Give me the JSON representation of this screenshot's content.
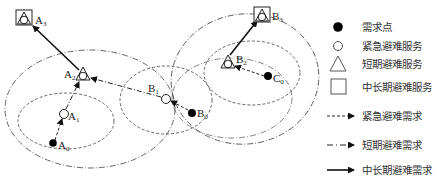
{
  "diagram": {
    "nodes": [
      {
        "id": "A0",
        "base": "A",
        "sub": "0",
        "type": "demand_point"
      },
      {
        "id": "A1",
        "base": "A",
        "sub": "1",
        "type": "emergency_service"
      },
      {
        "id": "A2",
        "base": "A",
        "sub": "2",
        "type": "short_term_service"
      },
      {
        "id": "A3",
        "base": "A",
        "sub": "3",
        "type": "long_term_service"
      },
      {
        "id": "B0",
        "base": "B",
        "sub": "0",
        "type": "demand_point"
      },
      {
        "id": "B1",
        "base": "B",
        "sub": "1",
        "type": "emergency_service"
      },
      {
        "id": "B2",
        "base": "B",
        "sub": "2",
        "type": "short_term_service"
      },
      {
        "id": "B3",
        "base": "B",
        "sub": "3",
        "type": "long_term_service"
      },
      {
        "id": "C0",
        "base": "C",
        "sub": "0",
        "type": "demand_point"
      }
    ],
    "edges": [
      {
        "from": "A0",
        "to": "A1",
        "type": "emergency"
      },
      {
        "from": "A1",
        "to": "A2",
        "type": "short_term"
      },
      {
        "from": "A2",
        "to": "A3",
        "type": "long_term"
      },
      {
        "from": "B0",
        "to": "B1",
        "type": "emergency"
      },
      {
        "from": "B1",
        "to": "A2",
        "type": "short_term"
      },
      {
        "from": "C0",
        "to": "B2",
        "type": "emergency"
      },
      {
        "from": "B2",
        "to": "B3",
        "type": "long_term"
      }
    ]
  },
  "legend": {
    "demand_point": "需求点",
    "emergency_service": "紧急避难服务",
    "short_term_service": "短期避难服务",
    "long_term_service": "中长期避难服务",
    "emergency_demand": "紧急避难需求",
    "short_term_demand": "短期避难需求",
    "long_term_demand": "中长期避难需求"
  }
}
